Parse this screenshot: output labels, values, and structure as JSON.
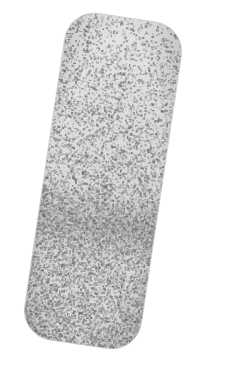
{
  "scene": {
    "width": 228,
    "height": 374,
    "background_color": "#ffffff",
    "description": "Speckled rounded-rectangle specimen on white background"
  },
  "specimen": {
    "name": "speckled-rounded-rectangle",
    "shape": "rounded-rectangle",
    "rotation_degrees": 8.5,
    "corner_radius": 30,
    "base_color": "#dcdcdc",
    "highlight_color": "#e9e9e9",
    "speckle_color_dark": "#6f6f6f",
    "speckle_color_mid": "#8f8f8f",
    "speckle_color_light": "#b4b4b4",
    "edge_shadow_color": "#c6c6c6",
    "unrotated_box": {
      "x": 44,
      "y": 16,
      "width": 118,
      "height": 330
    },
    "bounds_in_scene": {
      "left": 21,
      "top": 24,
      "right": 197,
      "bottom": 347
    },
    "corners": {
      "top_left": {
        "x": 34,
        "y": 40
      },
      "top_right": {
        "x": 148,
        "y": 24
      },
      "bottom_left": {
        "x": 70,
        "y": 330
      },
      "bottom_right": {
        "x": 188,
        "y": 312
      }
    }
  },
  "texture": {
    "type": "grayscale-speckle",
    "pattern": "random-dot",
    "density_gradient": "increases-top-to-bottom",
    "density_top": 0.18,
    "density_middle": 0.42,
    "density_bottom": 0.58,
    "speckle_size_px": 1.6,
    "dark_streak": {
      "present": true,
      "center_y_fraction": 0.63,
      "intensity": 0.35
    },
    "seed": 20240517
  },
  "chart_data": null
}
